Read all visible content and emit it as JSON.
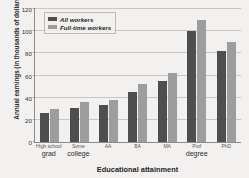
{
  "chart_data": {
    "type": "bar",
    "title": "",
    "xlabel": "Educational attainment",
    "ylabel": "Annual earnings (in thousands of dollars)",
    "categories": [
      "High school grad",
      "Some college",
      "AA",
      "BA",
      "MA",
      "Prof degree",
      "PhD"
    ],
    "category_lines": [
      {
        "line1": "High school",
        "line2": "grad"
      },
      {
        "line1": "Some",
        "line2": "college"
      },
      {
        "line1": "AA",
        "line2": ""
      },
      {
        "line1": "BA",
        "line2": ""
      },
      {
        "line1": "MA",
        "line2": ""
      },
      {
        "line1": "Prof",
        "line2": "degree"
      },
      {
        "line1": "PhD",
        "line2": ""
      }
    ],
    "series": [
      {
        "name": "All workers",
        "color": "#4e4e4e",
        "values": [
          26,
          31,
          33,
          45,
          55,
          100,
          82
        ]
      },
      {
        "name": "Full-time workers",
        "color": "#9d9d9d",
        "values": [
          30,
          36,
          38,
          52,
          62,
          110,
          90
        ]
      }
    ],
    "ylim": [
      0,
      120
    ],
    "yticks": [
      0,
      20,
      40,
      60,
      80,
      100,
      120
    ],
    "grid": true,
    "legend_position": "top-left"
  }
}
